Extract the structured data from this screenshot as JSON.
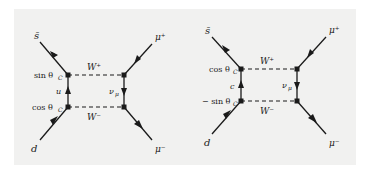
{
  "diagrams": [
    {
      "id": "left",
      "incoming_top": "s̄",
      "incoming_bottom": "d",
      "outgoing_top": "μ⁺",
      "outgoing_bottom": "μ⁻",
      "boson_top": "W⁺",
      "boson_bottom": "W⁻",
      "internal_quark": "u",
      "internal_lepton": "ν",
      "internal_lepton_sub": "μ",
      "coupling_top": "sin θ",
      "coupling_top_sub": "C",
      "coupling_bottom": "cos θ",
      "coupling_bottom_sub": "C"
    },
    {
      "id": "right",
      "incoming_top": "s̄",
      "incoming_bottom": "d",
      "outgoing_top": "μ⁺",
      "outgoing_bottom": "μ⁻",
      "boson_top": "W⁺",
      "boson_bottom": "W⁻",
      "internal_quark": "c",
      "internal_lepton": "ν",
      "internal_lepton_sub": "μ",
      "coupling_top": "cos θ",
      "coupling_top_sub": "C",
      "coupling_bottom": "− sin θ",
      "coupling_bottom_sub": "C"
    }
  ],
  "colors": {
    "line": "#1a1a1a",
    "background": "#f1f1f0"
  }
}
